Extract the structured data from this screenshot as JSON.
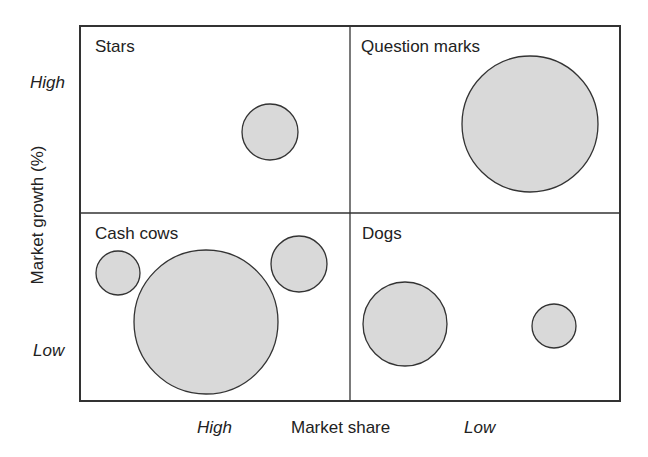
{
  "diagram": {
    "quadrants": [
      {
        "id": "stars",
        "label": "Stars"
      },
      {
        "id": "question-marks",
        "label": "Question marks"
      },
      {
        "id": "cash-cows",
        "label": "Cash cows"
      },
      {
        "id": "dogs",
        "label": "Dogs"
      }
    ],
    "axes": {
      "y_label": "Market growth (%)",
      "y_high": "High",
      "y_low": "Low",
      "x_label": "Market share",
      "x_high": "High",
      "x_low": "Low"
    },
    "colors": {
      "bubble_fill": "#d9d9d9",
      "bubble_stroke": "#333333",
      "frame": "#333333"
    }
  },
  "chart_data": {
    "type": "scatter",
    "title": "",
    "xlabel": "Market share",
    "ylabel": "Market growth (%)",
    "x_ticks": [
      "High",
      "Low"
    ],
    "y_ticks": [
      "High",
      "Low"
    ],
    "quadrants": [
      "Stars",
      "Question marks",
      "Cash cows",
      "Dogs"
    ],
    "bubbles": [
      {
        "quadrant": "Stars",
        "cx": 270,
        "cy": 132,
        "r": 28
      },
      {
        "quadrant": "Question marks",
        "cx": 530,
        "cy": 124,
        "r": 68
      },
      {
        "quadrant": "Cash cows",
        "cx": 118,
        "cy": 273,
        "r": 22
      },
      {
        "quadrant": "Cash cows",
        "cx": 206,
        "cy": 322,
        "r": 72
      },
      {
        "quadrant": "Cash cows",
        "cx": 299,
        "cy": 264,
        "r": 28
      },
      {
        "quadrant": "Dogs",
        "cx": 405,
        "cy": 324,
        "r": 42
      },
      {
        "quadrant": "Dogs",
        "cx": 554,
        "cy": 326,
        "r": 22
      }
    ],
    "grid": false
  }
}
